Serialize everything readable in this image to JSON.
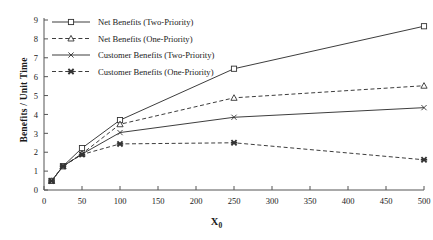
{
  "chart_data": {
    "type": "line",
    "title": "",
    "xlabel": "X0",
    "xlabel_base": "X",
    "xlabel_sub": "0",
    "ylabel": "Benefits / Unit Time",
    "xlim": [
      0,
      500
    ],
    "ylim": [
      0,
      9
    ],
    "xticks": [
      0,
      50,
      100,
      150,
      200,
      250,
      300,
      350,
      400,
      450,
      500
    ],
    "yticks": [
      0,
      1,
      2,
      3,
      4,
      5,
      6,
      7,
      8,
      9
    ],
    "grid": false,
    "legend_position": "top-left",
    "x": [
      10,
      25,
      50,
      100,
      250,
      500
    ],
    "series": [
      {
        "name": "Net Benefits (Two-Priority)",
        "marker": "open-square",
        "line": "solid",
        "color": "#333333",
        "values": [
          0.48,
          1.26,
          2.22,
          3.7,
          6.42,
          8.67
        ]
      },
      {
        "name": "Net Benefits (One-Priority)",
        "marker": "open-triangle",
        "line": "dashed",
        "color": "#333333",
        "values": [
          0.48,
          1.26,
          1.92,
          3.48,
          4.88,
          5.52
        ]
      },
      {
        "name": "Customer Benefits (Two-Priority)",
        "marker": "cross-x",
        "line": "solid",
        "color": "#333333",
        "values": [
          0.48,
          1.26,
          1.9,
          3.04,
          3.85,
          4.36
        ]
      },
      {
        "name": "Customer Benefits (One-Priority)",
        "marker": "bold-x",
        "line": "dashed",
        "color": "#333333",
        "values": [
          0.48,
          1.26,
          1.88,
          2.44,
          2.5,
          1.6
        ]
      }
    ]
  }
}
